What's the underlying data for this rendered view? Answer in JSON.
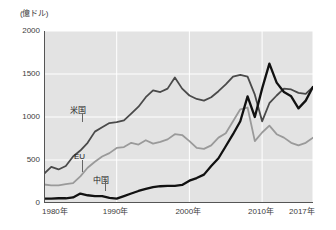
{
  "chart_data": {
    "type": "line",
    "title": "",
    "unit_label": "(億ドル)",
    "xlabel": "",
    "ylabel": "",
    "xlim": [
      1980,
      2017
    ],
    "ylim": [
      0,
      2000
    ],
    "grid": true,
    "legend_position": "inline-labels",
    "x_ticks": [
      "1980年",
      "1990年",
      "2000年",
      "2010年",
      "2017年"
    ],
    "x_tick_values": [
      1980,
      1990,
      2000,
      2010,
      2017
    ],
    "y_ticks": [
      "0",
      "500",
      "1000",
      "1500",
      "2000"
    ],
    "y_tick_values": [
      0,
      500,
      1000,
      1500,
      2000
    ],
    "x": [
      1980,
      1981,
      1982,
      1983,
      1984,
      1985,
      1986,
      1987,
      1988,
      1989,
      1990,
      1991,
      1992,
      1993,
      1994,
      1995,
      1996,
      1997,
      1998,
      1999,
      2000,
      2001,
      2002,
      2003,
      2004,
      2005,
      2006,
      2007,
      2008,
      2009,
      2010,
      2011,
      2012,
      2013,
      2014,
      2015,
      2016,
      2017
    ],
    "series": [
      {
        "name": "米国",
        "color": "#4a4a4a",
        "label_text": "米国",
        "values": [
          340,
          420,
          390,
          430,
          540,
          610,
          700,
          830,
          880,
          930,
          940,
          960,
          1040,
          1120,
          1230,
          1310,
          1290,
          1330,
          1460,
          1330,
          1250,
          1210,
          1190,
          1230,
          1300,
          1380,
          1470,
          1490,
          1470,
          1260,
          950,
          1160,
          1250,
          1330,
          1320,
          1280,
          1270,
          1350
        ]
      },
      {
        "name": "EU",
        "color": "#9a9a9a",
        "label_text": "EU",
        "values": [
          215,
          205,
          205,
          220,
          230,
          310,
          410,
          480,
          540,
          580,
          640,
          650,
          700,
          680,
          730,
          690,
          710,
          740,
          800,
          790,
          720,
          640,
          630,
          670,
          760,
          810,
          950,
          1090,
          1110,
          720,
          820,
          900,
          800,
          760,
          700,
          670,
          700,
          760
        ]
      },
      {
        "name": "中国",
        "color": "#111111",
        "label_text": "中国",
        "values": [
          50,
          50,
          55,
          55,
          65,
          110,
          90,
          80,
          80,
          60,
          50,
          80,
          110,
          140,
          165,
          185,
          195,
          200,
          200,
          210,
          260,
          290,
          330,
          430,
          520,
          660,
          800,
          950,
          1240,
          1000,
          1330,
          1620,
          1400,
          1290,
          1240,
          1100,
          1190,
          1350
        ]
      }
    ],
    "annotations": [
      {
        "text": "米国",
        "series": "米国"
      },
      {
        "text": "EU",
        "series": "EU"
      },
      {
        "text": "中国",
        "series": "中国"
      }
    ]
  }
}
